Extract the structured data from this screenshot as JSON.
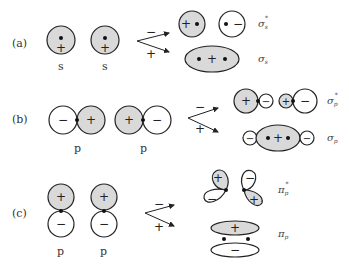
{
  "rows": [
    {
      "tag": "(a)",
      "atoms": [
        "s",
        "s"
      ],
      "arrow_top": "−",
      "arrow_bottom": "+",
      "antibonding": {
        "symbol": "σ",
        "sub": "s",
        "sup": "*"
      },
      "bonding": {
        "symbol": "σ",
        "sub": "s"
      }
    },
    {
      "tag": "(b)",
      "atoms": [
        "p",
        "p"
      ],
      "arrow_top": "−",
      "arrow_bottom": "+",
      "antibonding": {
        "symbol": "σ",
        "sub": "p",
        "sup": "*"
      },
      "bonding": {
        "symbol": "σ",
        "sub": "p"
      }
    },
    {
      "tag": "(c)",
      "atoms": [
        "p",
        "p"
      ],
      "arrow_top": "−",
      "arrow_bottom": "+",
      "antibonding": {
        "symbol": "π",
        "sub": "p",
        "sup": "*"
      },
      "bonding": {
        "symbol": "π",
        "sub": "p"
      }
    }
  ],
  "signs": {
    "plus": "+",
    "minus": "−"
  },
  "colors": {
    "lobe_fill": "#d9d9d9",
    "stroke": "#222222"
  }
}
